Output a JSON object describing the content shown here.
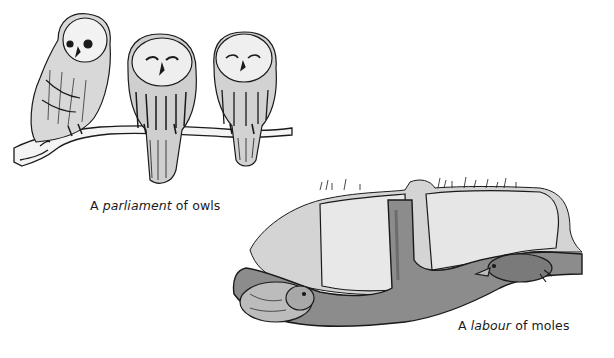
{
  "figures": [
    {
      "id": "owls",
      "subject": "three owls perched on a branch",
      "caption": {
        "prefix": "A ",
        "emphasis": "parliament",
        "suffix": " of owls"
      }
    },
    {
      "id": "moles",
      "subject": "two moles in an underground tunnel",
      "caption": {
        "prefix": "A ",
        "emphasis": "labour",
        "suffix": " of moles"
      }
    }
  ],
  "colors": {
    "ink": "#1a1a1a",
    "soil_light": "#c9c9c9",
    "tunnel": "#8a8a8a",
    "background": "#ffffff"
  }
}
